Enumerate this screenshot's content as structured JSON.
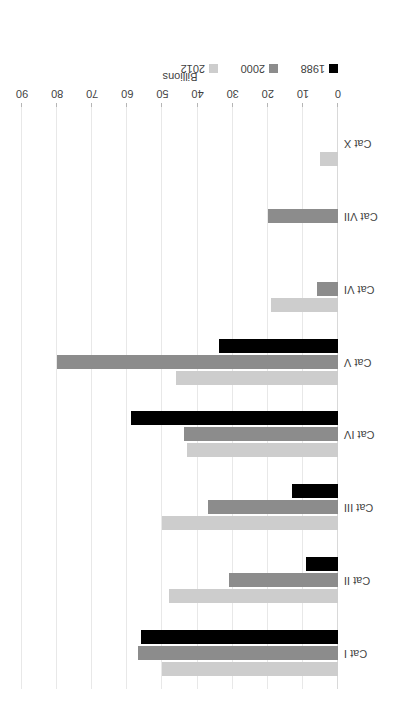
{
  "chart_data": {
    "type": "bar",
    "orientation": "horizontal",
    "title": "",
    "xlabel": "Billions",
    "ylabel": "",
    "xlim": [
      0,
      90
    ],
    "xticks": [
      0,
      10,
      20,
      30,
      40,
      50,
      60,
      70,
      80,
      90
    ],
    "xtick_labels": [
      "0",
      "10",
      "20",
      "30",
      "40",
      "50",
      "60",
      "70",
      "80",
      "90"
    ],
    "grid": true,
    "grid_axis": "x",
    "legend_position": "bottom-left",
    "rotated_180": true,
    "categories": [
      "Cat I",
      "Cat II",
      "Cat III",
      "Cat IV",
      "Cat V",
      "Cat VI",
      "Cat VII",
      "Cat X"
    ],
    "series": [
      {
        "name": "1988",
        "color": "#000000",
        "values": [
          56,
          9,
          13,
          59,
          34,
          0,
          0,
          0
        ]
      },
      {
        "name": "2000",
        "color": "#8c8c8c",
        "values": [
          57,
          31,
          37,
          44,
          80,
          6,
          20,
          0
        ]
      },
      {
        "name": "2012",
        "color": "#cdcdcd",
        "values": [
          50,
          48,
          50,
          43,
          46,
          19,
          0,
          5
        ]
      }
    ]
  },
  "axis": {
    "title": "Billions",
    "tick_labels": [
      "0",
      "10",
      "20",
      "30",
      "40",
      "50",
      "60",
      "70",
      "80",
      "90"
    ]
  },
  "legend": {
    "items": [
      {
        "label": "1988",
        "swatch": "y1988"
      },
      {
        "label": "2000",
        "swatch": "y2000"
      },
      {
        "label": "2012",
        "swatch": "y2012"
      }
    ]
  },
  "categories": [
    "Cat I",
    "Cat II",
    "Cat III",
    "Cat IV",
    "Cat V",
    "Cat VI",
    "Cat VII",
    "Cat X"
  ]
}
